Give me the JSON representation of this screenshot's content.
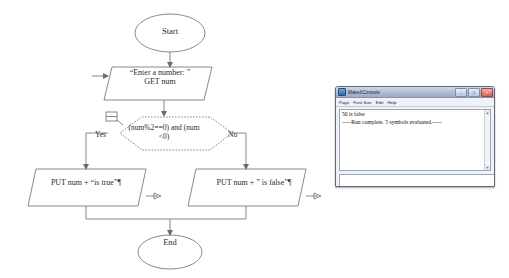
{
  "flowchart": {
    "start_label": "Start",
    "end_label": "End",
    "input_text": "“Enter a number: ”\nGET num",
    "condition_text": "(num%2==0) and (num\n<0)",
    "yes_label": "Yes",
    "no_label": "No",
    "output_true_text": "PUT num +  “is true”¶",
    "output_false_text": "PUT num +  ” is false”¶",
    "line_color": "#6b6b6b",
    "text_color": "#2b2b2b"
  },
  "console_window": {
    "title": "MakeItConsole",
    "window_icon": "app-icon",
    "buttons": {
      "minimize": "–",
      "maximize": "□",
      "close": "×"
    },
    "menu": [
      "Page",
      "Font Size",
      "Edit",
      "Help"
    ],
    "output_lines": [
      "50 is false",
      "-----Run complete.  5 symbols evaluated.-----"
    ],
    "command_input_value": "",
    "command_input_placeholder": "",
    "clear_button_label": "Clear",
    "scroll_up_glyph": "▲",
    "scroll_down_glyph": "▼"
  }
}
